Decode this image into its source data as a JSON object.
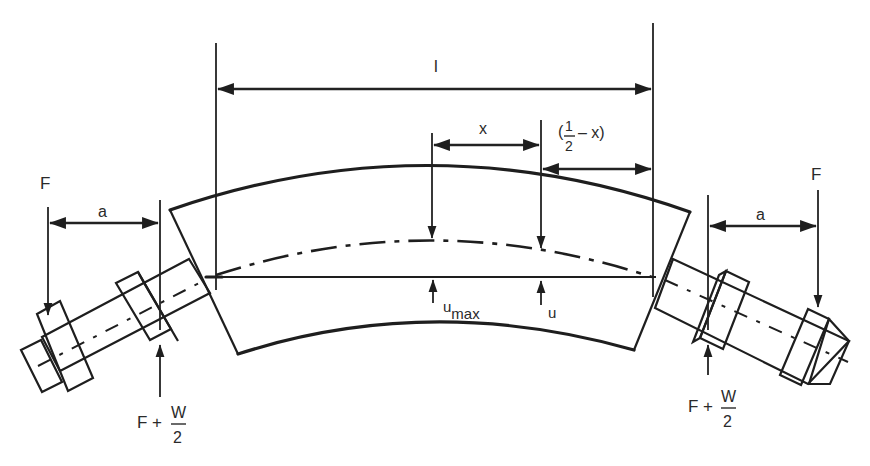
{
  "diagram": {
    "labels": {
      "span": "l",
      "x": "x",
      "half_minus_x_open": "(",
      "half_minus_x_num": "1",
      "half_minus_x_den": "2",
      "half_minus_x_tail": "– x)",
      "u_max_base": "u",
      "u_max_sub": "max",
      "u": "u",
      "left_force": "F",
      "right_force": "F",
      "left_offset": "a",
      "right_offset": "a",
      "left_reaction_prefix": "F +",
      "left_reaction_num": "W",
      "left_reaction_den": "2",
      "right_reaction_prefix": "F +",
      "right_reaction_num": "W",
      "right_reaction_den": "2"
    },
    "colors": {
      "ink": "#1e1e1e",
      "text": "#2a2a2a",
      "background": "#ffffff"
    }
  }
}
